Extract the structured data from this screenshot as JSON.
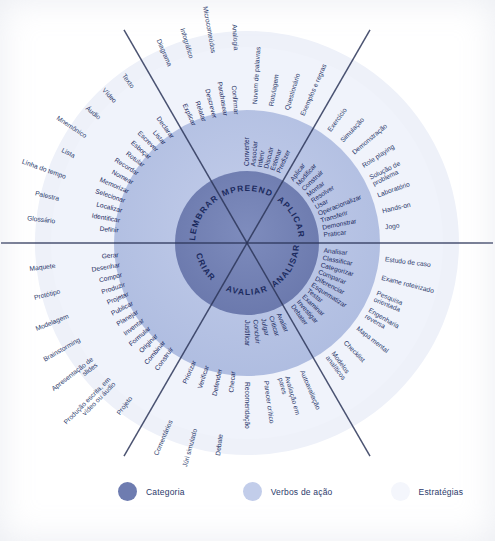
{
  "meta": {
    "language": "pt-BR"
  },
  "colors": {
    "category_ring": "#6e7cb0",
    "verbs_ring": "#b6c2e4",
    "strategies_ring": "#f0f3fb",
    "outer_halo": "#eef1f9",
    "text_dark": "#1b2a5e",
    "text_mid": "#2b3a6b",
    "divider": "#2b3558",
    "background": "#ffffff"
  },
  "legend": {
    "items": [
      {
        "label": "Categoria",
        "color": "#6e7cb0"
      },
      {
        "label": "Verbos de ação",
        "color": "#c2cdea"
      },
      {
        "label": "Estratégias",
        "color": "#f4f6fc"
      }
    ]
  },
  "wheel": {
    "center": {
      "x": 247,
      "y": 243
    },
    "radii": {
      "category_outer": 72,
      "verbs_outer": 133,
      "strategies_outer": 196,
      "halo_outer": 212
    },
    "sectors": [
      {
        "id": "lembrar",
        "category": "LEMBRAR",
        "start_angle": 180,
        "end_angle": 240,
        "verbs": [
          "Definir",
          "Identificar",
          "Localizar",
          "Selecionar",
          "Memorizar",
          "Nomear",
          "Recordar",
          "Rotular",
          "Esboçar",
          "Escrever",
          "Listar",
          "Declarar"
        ],
        "strategies": [
          "Glossário",
          "Palestra",
          "Linha do tempo",
          "Lista",
          "Mnemônico",
          "Áudio",
          "Vídeo",
          "Texto"
        ]
      },
      {
        "id": "compreender",
        "category": "COMPREENDER",
        "start_angle": 240,
        "end_angle": 300,
        "verbs": [
          "Explicar",
          "Relatar",
          "Descrever",
          "Parafrasear",
          "Confirmar",
          "Converter",
          "Associar",
          "Inferir",
          "Discutir",
          "Estimar",
          "Predizer"
        ],
        "strategies": [
          "Diagrama",
          "Infográfico",
          "Microconteúdos",
          "Analogia",
          "Nuvem de palavras",
          "Rotulagem",
          "Questionário",
          "Exemplos e regras"
        ]
      },
      {
        "id": "aplicar",
        "category": "APLICAR",
        "start_angle": 300,
        "end_angle": 360,
        "verbs": [
          "Aplicar",
          "Modificar",
          "Construir",
          "Montar",
          "Resolver",
          "Usar",
          "Operacionalizar",
          "Transferir",
          "Demonstrar",
          "Praticar"
        ],
        "strategies": [
          "Exercício",
          "Simulação",
          "Demonstração",
          "Role playing",
          "Solução de problema",
          "Laboratório",
          "Hands-on",
          "Jogo"
        ]
      },
      {
        "id": "analisar",
        "category": "ANALISAR",
        "start_angle": 0,
        "end_angle": 60,
        "verbs": [
          "Analisar",
          "Classificar",
          "Categorizar",
          "Comparar",
          "Diferenciar",
          "Esquematizar",
          "Testar",
          "Examinar",
          "Investigar",
          "Debater"
        ],
        "strategies": [
          "Estudo de caso",
          "Exame roteirizado",
          "Pesquisa orientada",
          "Engenharia reversa",
          "Mapa mental",
          "Checklist",
          "Modelos analíticos"
        ]
      },
      {
        "id": "avaliar",
        "category": "AVALIAR",
        "start_angle": 60,
        "end_angle": 120,
        "verbs": [
          "Avaliar",
          "Criticar",
          "Julgar",
          "Concluir",
          "Justificar",
          "Checar",
          "Defender",
          "Verificar",
          "Priorizar"
        ],
        "strategies": [
          "Autoavaliação",
          "Avaliação em pares",
          "Parecer crítico",
          "Recomendação",
          "Debate",
          "Júri simulado",
          "Comentários"
        ]
      },
      {
        "id": "criar",
        "category": "CRIAR",
        "start_angle": 120,
        "end_angle": 180,
        "verbs": [
          "Construir",
          "Combinar",
          "Originar",
          "Formular",
          "Inventar",
          "Planejar",
          "Publicar",
          "Projetar",
          "Produzir",
          "Compor",
          "Desenhar",
          "Gerar"
        ],
        "strategies": [
          "Projeto",
          "Produção escrita, em vídeo ou áudio",
          "Apresentação de slides",
          "Brainstorming",
          "Modelagem",
          "Protótipo",
          "Maquete"
        ]
      }
    ]
  }
}
